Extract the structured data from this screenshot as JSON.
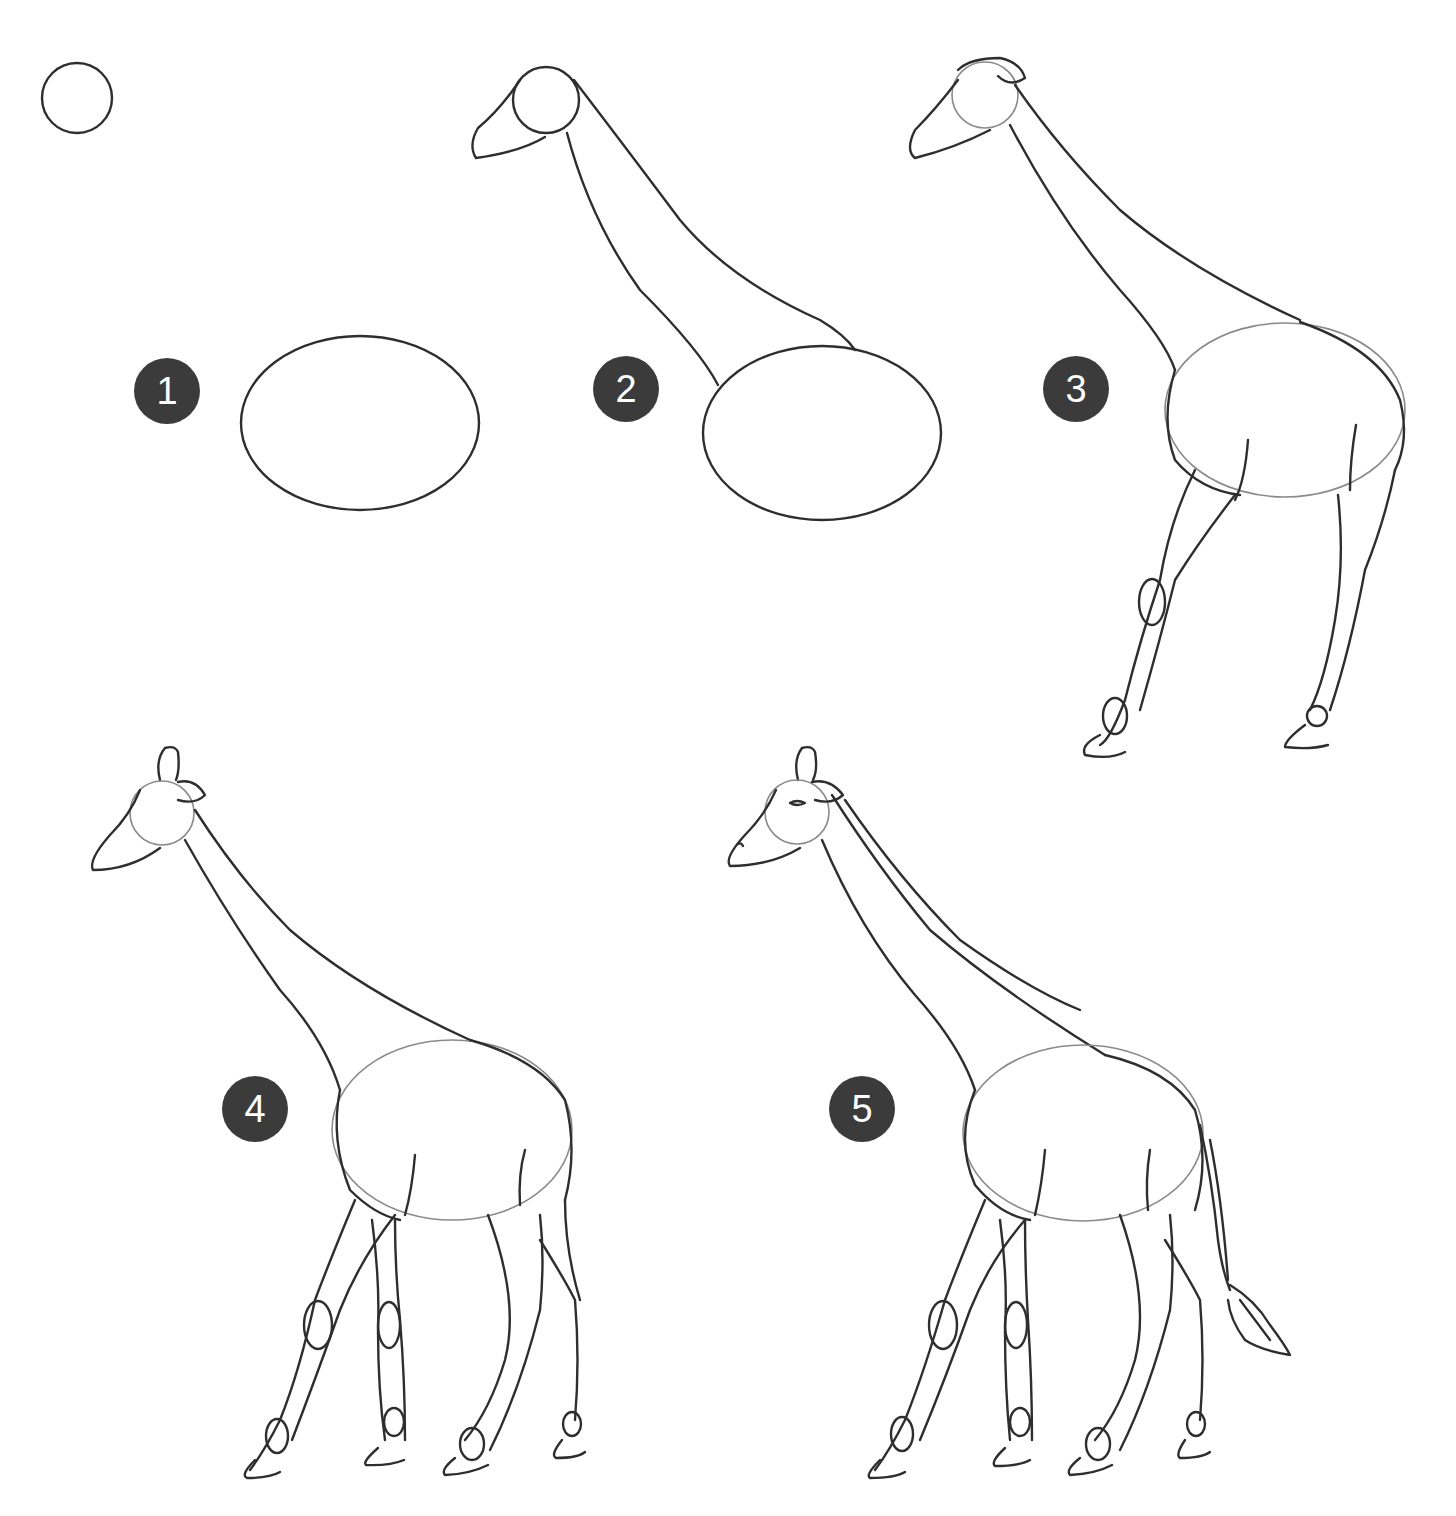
{
  "page": {
    "steps": [
      {
        "number": "1",
        "description": "Circle for head and oval for body"
      },
      {
        "number": "2",
        "description": "Add muzzle and neck connecting to body"
      },
      {
        "number": "3",
        "description": "Add ear details and two legs with joints and hooves"
      },
      {
        "number": "4",
        "description": "Add ossicones and remaining two legs"
      },
      {
        "number": "5",
        "description": "Add eye, nostril, mane line and tail"
      }
    ],
    "colors": {
      "badge": "#3b3b3b",
      "badge_text": "#ffffff",
      "line": "#2e2e2e",
      "background": "#ffffff"
    }
  }
}
